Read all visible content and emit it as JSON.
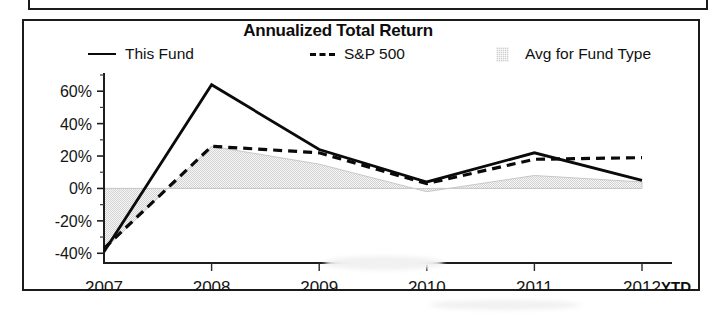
{
  "chart_data": {
    "type": "line",
    "title": "Annualized Total Return",
    "xlabel": "",
    "ylabel": "",
    "categories": [
      "2007",
      "2008",
      "2009",
      "2010",
      "2011",
      "2012"
    ],
    "x_axis_suffix": "YTD",
    "ytick_labels": [
      "60%",
      "40%",
      "20%",
      "0%",
      "-20%",
      "-40%"
    ],
    "ytick_values": [
      60,
      40,
      20,
      0,
      -20,
      -40
    ],
    "ylim": [
      -46,
      70
    ],
    "grid": false,
    "legend_position": "top",
    "series": [
      {
        "name": "This Fund",
        "style": "solid",
        "color": "#0a0a0a",
        "values": [
          -39,
          64,
          24,
          4,
          22,
          5
        ]
      },
      {
        "name": "S&P 500",
        "style": "dashed",
        "color": "#0a0a0a",
        "values": [
          -37,
          26,
          22,
          3,
          18,
          19
        ]
      },
      {
        "name": "Avg for Fund Type",
        "style": "filled-area",
        "color": "#cfcfcf",
        "values": [
          -38,
          26,
          15,
          -2,
          8,
          4
        ]
      }
    ]
  },
  "chart": {
    "title": "Annualized Total Return",
    "legend": {
      "this_fund": "This Fund",
      "sp500": "S&P 500",
      "avg_fund_type": "Avg for Fund Type"
    },
    "axis": {
      "ytd_label": "YTD"
    }
  }
}
